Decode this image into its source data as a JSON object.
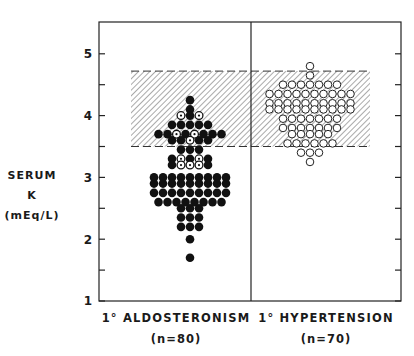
{
  "chart_data": {
    "type": "scatter",
    "subtype": "dot-strip",
    "title": "",
    "ylabel": "SERUM K (mEq/L)",
    "ylabel_lines": [
      "SERUM K",
      "(mEq/L)"
    ],
    "ylim": [
      1,
      5.5
    ],
    "yticks": [
      1,
      2,
      3,
      4,
      5
    ],
    "minor_yticks": [
      1.5,
      2.5,
      3.5,
      4.5
    ],
    "grid": false,
    "normal_range": {
      "low": 3.5,
      "high": 4.72,
      "style": "diagonal-hatch",
      "description": "shaded normal range band"
    },
    "groups": [
      {
        "name": "1° ALDOSTERONISM",
        "n_label": "(n=80)",
        "n": 80,
        "marker": "filled circle (some dotted-open circles)"
      },
      {
        "name": "1° HYPERTENSION",
        "n_label": "(n=70)",
        "n": 70,
        "marker": "open circle"
      }
    ],
    "series": [
      {
        "name": "1° ALDOSTERONISM",
        "rows": [
          {
            "y": 4.25,
            "count": 1
          },
          {
            "y": 4.1,
            "count": 1
          },
          {
            "y": 4.0,
            "count": 3,
            "open": [
              0,
              2
            ]
          },
          {
            "y": 3.85,
            "count": 5
          },
          {
            "y": 3.7,
            "count": 8,
            "open": [
              2,
              4
            ]
          },
          {
            "y": 3.6,
            "count": 5,
            "open": [
              2
            ]
          },
          {
            "y": 3.45,
            "count": 3
          },
          {
            "y": 3.3,
            "count": 5,
            "open": [
              1,
              3
            ]
          },
          {
            "y": 3.2,
            "count": 5,
            "open": [
              1,
              2,
              3
            ]
          },
          {
            "y": 3.0,
            "count": 9
          },
          {
            "y": 2.9,
            "count": 9
          },
          {
            "y": 2.75,
            "count": 9
          },
          {
            "y": 2.6,
            "count": 8
          },
          {
            "y": 2.5,
            "count": 3
          },
          {
            "y": 2.35,
            "count": 3
          },
          {
            "y": 2.2,
            "count": 3
          },
          {
            "y": 2.0,
            "count": 1
          },
          {
            "y": 1.7,
            "count": 1
          }
        ]
      },
      {
        "name": "1° HYPERTENSION",
        "rows": [
          {
            "y": 4.8,
            "count": 1
          },
          {
            "y": 4.65,
            "count": 1
          },
          {
            "y": 4.5,
            "count": 7
          },
          {
            "y": 4.35,
            "count": 10
          },
          {
            "y": 4.2,
            "count": 10
          },
          {
            "y": 4.1,
            "count": 10
          },
          {
            "y": 3.95,
            "count": 7
          },
          {
            "y": 3.8,
            "count": 7
          },
          {
            "y": 3.7,
            "count": 5
          },
          {
            "y": 3.55,
            "count": 6
          },
          {
            "y": 3.4,
            "count": 3
          },
          {
            "y": 3.25,
            "count": 1
          }
        ]
      }
    ]
  },
  "axis": {
    "y_title_line1": "SERUM K",
    "y_title_line2": "(mEq/L)",
    "tick_labels": [
      "1",
      "2",
      "3",
      "4",
      "5"
    ]
  },
  "categories": [
    {
      "label": "1° ALDOSTERONISM",
      "n": "(n=80)"
    },
    {
      "label": "1° HYPERTENSION",
      "n": "(n=70)"
    }
  ]
}
